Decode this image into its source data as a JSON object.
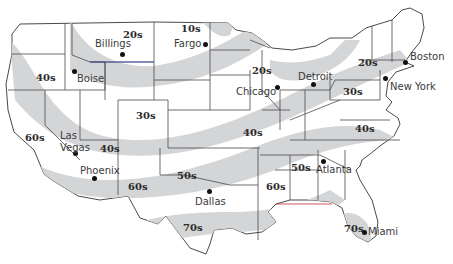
{
  "map": {
    "title": "US temperature zones",
    "colors": {
      "band": "#d4d5d7",
      "border": "#4a4a4a",
      "background": "#ffffff",
      "accent_blue": "#3b4bb0",
      "accent_red": "#c0303a"
    },
    "zones": [
      {
        "id": "z1",
        "label": "10s",
        "x": 181,
        "y": 24
      },
      {
        "id": "z2",
        "label": "20s",
        "x": 123,
        "y": 30
      },
      {
        "id": "z3",
        "label": "20s",
        "x": 252,
        "y": 66
      },
      {
        "id": "z4",
        "label": "20s",
        "x": 358,
        "y": 58
      },
      {
        "id": "z5",
        "label": "30s",
        "x": 136,
        "y": 111
      },
      {
        "id": "z6",
        "label": "30s",
        "x": 343,
        "y": 87
      },
      {
        "id": "z7",
        "label": "40s",
        "x": 36,
        "y": 73
      },
      {
        "id": "z8",
        "label": "40s",
        "x": 100,
        "y": 144
      },
      {
        "id": "z9",
        "label": "40s",
        "x": 243,
        "y": 128
      },
      {
        "id": "z10",
        "label": "40s",
        "x": 355,
        "y": 124
      },
      {
        "id": "z11",
        "label": "50s",
        "x": 177,
        "y": 171
      },
      {
        "id": "z12",
        "label": "50s",
        "x": 291,
        "y": 163
      },
      {
        "id": "z13",
        "label": "60s",
        "x": 25,
        "y": 133
      },
      {
        "id": "z14",
        "label": "60s",
        "x": 128,
        "y": 182
      },
      {
        "id": "z15",
        "label": "60s",
        "x": 266,
        "y": 182
      },
      {
        "id": "z16",
        "label": "70s",
        "x": 183,
        "y": 223
      },
      {
        "id": "z17",
        "label": "70s",
        "x": 344,
        "y": 224
      }
    ],
    "cities": [
      {
        "name": "Billings",
        "dot_x": 122,
        "dot_y": 54,
        "label_x": 95,
        "label_y": 39
      },
      {
        "name": "Fargo",
        "dot_x": 205,
        "dot_y": 44,
        "label_x": 174,
        "label_y": 39
      },
      {
        "name": "Boise",
        "dot_x": 74,
        "dot_y": 71,
        "label_x": 77,
        "label_y": 74
      },
      {
        "name": "Chicago",
        "dot_x": 277,
        "dot_y": 87,
        "label_x": 236,
        "label_y": 87
      },
      {
        "name": "Detroit",
        "dot_x": 313,
        "dot_y": 84,
        "label_x": 298,
        "label_y": 72
      },
      {
        "name": "Boston",
        "dot_x": 405,
        "dot_y": 62,
        "label_x": 410,
        "label_y": 52
      },
      {
        "name": "New York",
        "dot_x": 385,
        "dot_y": 78,
        "label_x": 390,
        "label_y": 82
      },
      {
        "name": "Las Vegas",
        "dot_x": 75,
        "dot_y": 153,
        "label_x": 60,
        "label_y": 130
      },
      {
        "name": "Phoenix",
        "dot_x": 94,
        "dot_y": 178,
        "label_x": 80,
        "label_y": 166
      },
      {
        "name": "Dallas",
        "dot_x": 209,
        "dot_y": 191,
        "label_x": 195,
        "label_y": 197
      },
      {
        "name": "Atlanta",
        "dot_x": 323,
        "dot_y": 161,
        "label_x": 316,
        "label_y": 165
      },
      {
        "name": "Miami",
        "dot_x": 364,
        "dot_y": 232,
        "label_x": 368,
        "label_y": 227
      }
    ]
  }
}
